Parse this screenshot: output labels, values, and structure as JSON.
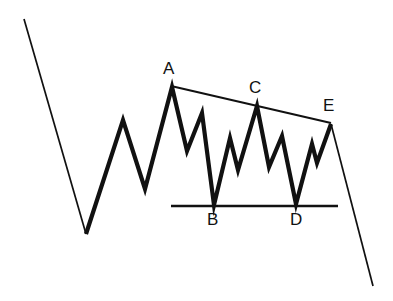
{
  "figure": {
    "width": 393,
    "height": 301,
    "background_color": "#ffffff",
    "stroke_color": "#111111"
  },
  "labels": [
    {
      "id": "A",
      "text": "A",
      "x": 163,
      "y": 60
    },
    {
      "id": "B",
      "text": "B",
      "x": 207,
      "y": 211
    },
    {
      "id": "C",
      "text": "C",
      "x": 249,
      "y": 79
    },
    {
      "id": "D",
      "text": "D",
      "x": 290,
      "y": 211
    },
    {
      "id": "E",
      "text": "E",
      "x": 323,
      "y": 97
    }
  ],
  "chart_data": {
    "type": "line",
    "xlabel": "",
    "ylabel": "",
    "grid": false,
    "legend": "none",
    "xlim": [
      0,
      393
    ],
    "ylim": [
      301,
      0
    ],
    "note": "Pixel coordinates; y increases downward. Price-action schematic: impulse decline, rally into a descending triangle labelled A-B-C-D-E, then breakdown.",
    "series": [
      {
        "name": "lead-in-decline",
        "style": "thin",
        "points": [
          [
            24,
            19
          ],
          [
            86,
            234
          ]
        ]
      },
      {
        "name": "wave-structure",
        "style": "thick",
        "points": [
          [
            86,
            234
          ],
          [
            123,
            120
          ],
          [
            145,
            189
          ],
          [
            172,
            87
          ],
          [
            187,
            151
          ],
          [
            202,
            113
          ],
          [
            214,
            205
          ],
          [
            230,
            138
          ],
          [
            238,
            170
          ],
          [
            257,
            106
          ],
          [
            269,
            167
          ],
          [
            282,
            136
          ],
          [
            296,
            204
          ],
          [
            312,
            144
          ],
          [
            317,
            163
          ],
          [
            331,
            124
          ]
        ]
      },
      {
        "name": "breakdown-decline",
        "style": "thin",
        "points": [
          [
            331,
            124
          ],
          [
            373,
            286
          ]
        ]
      },
      {
        "name": "upper-trendline-resistance",
        "style": "trendline",
        "points": [
          [
            171,
            86
          ],
          [
            331,
            123
          ]
        ]
      },
      {
        "name": "lower-trendline-support",
        "style": "support",
        "points": [
          [
            171,
            206
          ],
          [
            338,
            206
          ]
        ]
      }
    ],
    "labeled_points": [
      {
        "label": "A",
        "x": 172,
        "y": 87,
        "role": "swing-high"
      },
      {
        "label": "B",
        "x": 214,
        "y": 205,
        "role": "swing-low"
      },
      {
        "label": "C",
        "x": 257,
        "y": 106,
        "role": "swing-high"
      },
      {
        "label": "D",
        "x": 296,
        "y": 204,
        "role": "swing-low"
      },
      {
        "label": "E",
        "x": 331,
        "y": 124,
        "role": "swing-high"
      }
    ]
  }
}
